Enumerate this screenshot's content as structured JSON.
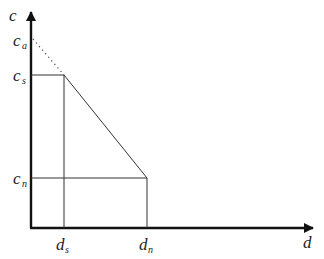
{
  "diagram": {
    "axes": {
      "y_label": "c",
      "x_label": "d",
      "color": "#111111"
    },
    "y_ticks": [
      {
        "base": "c",
        "sub": "a",
        "name": "c_a"
      },
      {
        "base": "c",
        "sub": "s",
        "name": "c_s"
      },
      {
        "base": "c",
        "sub": "n",
        "name": "c_n"
      }
    ],
    "x_ticks": [
      {
        "base": "d",
        "sub": "s",
        "name": "d_s"
      },
      {
        "base": "d",
        "sub": "n",
        "name": "d_n"
      }
    ],
    "line_color": "#333333",
    "dotted_color": "#444444"
  }
}
